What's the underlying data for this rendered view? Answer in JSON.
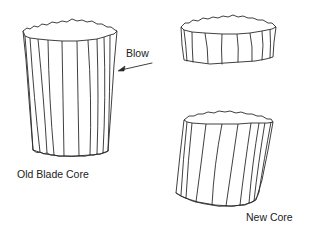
{
  "figure": {
    "labels": {
      "old_core": "Old Blade Core",
      "new_core": "New Core",
      "blow": "Blow"
    },
    "elements": [
      {
        "name": "old-blade-core",
        "description": "tall fluted cylindrical stone core"
      },
      {
        "name": "detached-platform-piece",
        "description": "short fluted disc removed from top of core"
      },
      {
        "name": "new-core",
        "description": "remaining fluted core with fresh angled platform"
      },
      {
        "name": "blow-arrow",
        "description": "arrow indicating direction of blow striking the side near the top"
      }
    ],
    "colors": {
      "line": "#2a2a2a",
      "background": "#ffffff",
      "text": "#222222"
    }
  }
}
